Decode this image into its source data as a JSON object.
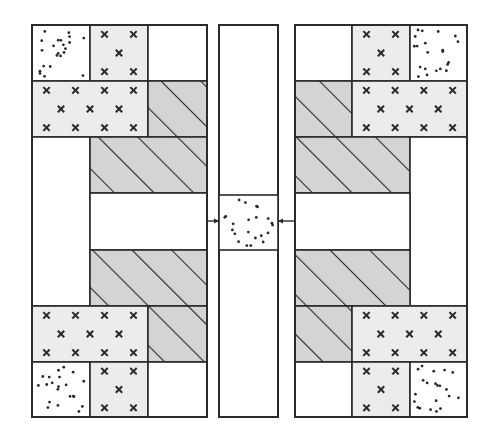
{
  "figure": {
    "title": "Symmetric block diagram with central column and inward arrows",
    "description": "Two mirrored blocks of patterned cells flank a narrow central column containing a dotted segment; arrows point inward toward it."
  },
  "colors": {
    "background": "#ffffff",
    "stroke": "#2a2a2a",
    "hatch_fill": "#d4d4d4",
    "xmark_fill": "#ececec",
    "dot_fill": "#ffffff",
    "blank_fill": "#ffffff"
  },
  "legend_patterns": [
    {
      "id": "dots",
      "label": "dotted"
    },
    {
      "id": "xmarks",
      "label": "x-marked"
    },
    {
      "id": "hatch",
      "label": "diagonal hatch"
    },
    {
      "id": "blank",
      "label": "blank"
    }
  ],
  "left_block": {
    "frame": [
      32,
      25,
      207,
      417
    ],
    "cells": [
      {
        "x": 32,
        "y": 25,
        "w": 58,
        "h": 56,
        "pattern": "dots"
      },
      {
        "x": 90,
        "y": 25,
        "w": 58,
        "h": 56,
        "pattern": "xmarks"
      },
      {
        "x": 148,
        "y": 25,
        "w": 59,
        "h": 56,
        "pattern": "blank"
      },
      {
        "x": 32,
        "y": 81,
        "w": 116,
        "h": 56,
        "pattern": "xmarks"
      },
      {
        "x": 148,
        "y": 81,
        "w": 59,
        "h": 56,
        "pattern": "hatch"
      },
      {
        "x": 32,
        "y": 137,
        "w": 58,
        "h": 169,
        "pattern": "blank"
      },
      {
        "x": 90,
        "y": 137,
        "w": 117,
        "h": 56,
        "pattern": "hatch"
      },
      {
        "x": 90,
        "y": 193,
        "w": 117,
        "h": 57,
        "pattern": "blank"
      },
      {
        "x": 90,
        "y": 250,
        "w": 117,
        "h": 56,
        "pattern": "hatch"
      },
      {
        "x": 32,
        "y": 306,
        "w": 116,
        "h": 56,
        "pattern": "xmarks"
      },
      {
        "x": 148,
        "y": 306,
        "w": 59,
        "h": 56,
        "pattern": "hatch"
      },
      {
        "x": 32,
        "y": 362,
        "w": 58,
        "h": 55,
        "pattern": "dots"
      },
      {
        "x": 90,
        "y": 362,
        "w": 58,
        "h": 55,
        "pattern": "xmarks"
      },
      {
        "x": 148,
        "y": 362,
        "w": 59,
        "h": 55,
        "pattern": "blank"
      }
    ]
  },
  "right_block": {
    "frame": [
      295,
      25,
      467,
      417
    ],
    "cells": [
      {
        "x": 295,
        "y": 25,
        "w": 57,
        "h": 56,
        "pattern": "blank"
      },
      {
        "x": 352,
        "y": 25,
        "w": 58,
        "h": 56,
        "pattern": "xmarks"
      },
      {
        "x": 410,
        "y": 25,
        "w": 57,
        "h": 56,
        "pattern": "dots"
      },
      {
        "x": 295,
        "y": 81,
        "w": 57,
        "h": 56,
        "pattern": "hatch"
      },
      {
        "x": 352,
        "y": 81,
        "w": 115,
        "h": 56,
        "pattern": "xmarks"
      },
      {
        "x": 295,
        "y": 137,
        "w": 115,
        "h": 56,
        "pattern": "hatch"
      },
      {
        "x": 410,
        "y": 137,
        "w": 57,
        "h": 169,
        "pattern": "blank"
      },
      {
        "x": 295,
        "y": 193,
        "w": 115,
        "h": 57,
        "pattern": "blank"
      },
      {
        "x": 295,
        "y": 250,
        "w": 115,
        "h": 56,
        "pattern": "hatch"
      },
      {
        "x": 295,
        "y": 306,
        "w": 57,
        "h": 56,
        "pattern": "hatch"
      },
      {
        "x": 352,
        "y": 306,
        "w": 115,
        "h": 56,
        "pattern": "xmarks"
      },
      {
        "x": 295,
        "y": 362,
        "w": 57,
        "h": 55,
        "pattern": "blank"
      },
      {
        "x": 352,
        "y": 362,
        "w": 58,
        "h": 55,
        "pattern": "xmarks"
      },
      {
        "x": 410,
        "y": 362,
        "w": 57,
        "h": 55,
        "pattern": "dots"
      }
    ]
  },
  "center_column": {
    "frame": [
      219,
      25,
      278,
      417
    ],
    "segment": {
      "x": 219,
      "y": 195,
      "w": 59,
      "h": 55,
      "pattern": "dots"
    }
  },
  "arrows": [
    {
      "name": "left-arrow",
      "from": [
        207,
        221
      ],
      "to": [
        219,
        221
      ],
      "direction": "right"
    },
    {
      "name": "right-arrow",
      "from": [
        295,
        221
      ],
      "to": [
        278,
        221
      ],
      "direction": "left"
    }
  ]
}
